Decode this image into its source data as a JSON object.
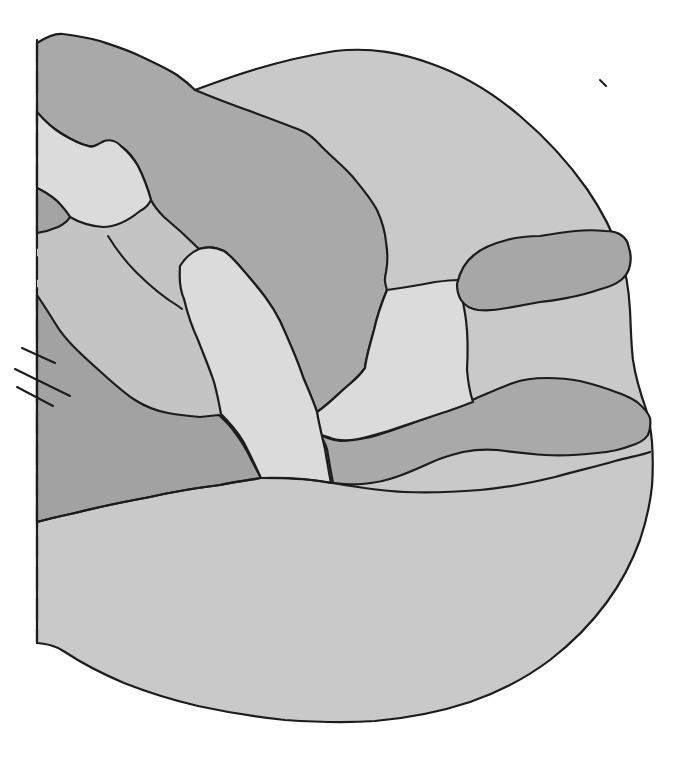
{
  "canvas": {
    "width": 688,
    "height": 764,
    "background_color": "#ffffff"
  },
  "figure": {
    "kind": "grayscale anatomical/embryological line illustration with shaded regions",
    "palette": {
      "outline": "#1c1c1c",
      "disc": "#c9c9c9",
      "channel": "#c4c4c4",
      "band_dark": "#a9a9a9",
      "region_b": "#a2a2a2",
      "light_lobe": "#dbdbdb",
      "tongue": "#a4a4a4",
      "ellipse": "#a7a7a7"
    },
    "stroke_width": 2.2,
    "thin_stroke_width": 2.0,
    "midline_dash": "22 9",
    "shapes": [
      {
        "name": "main-disc",
        "fill_key": "disc",
        "stroked": true,
        "d": "M37,110 C70,102 120,95 195,90 C225,79 272,61 335,51 C372,47 402,53 432,64 C463,75 493,93 520,116 C546,138 568,162 587,189 C602,211 613,232 620,254 C627,274 629,292 630,310 C631,330 631,344 633,360 C636,380 641,395 646,409 C649,419 651,430 652,442 C653,457 653,472 652,486 C650,505 646,522 640,540 C632,562 621,583 607,602 C591,624 572,643 550,660 C526,678 499,692 470,702 C440,712 408,718 375,721 C345,723 315,722 285,720 C255,717 226,712 198,706 C172,700 147,692 124,683 C103,674 83,664 65,652 C55,645 46,644 37,643 Z"
      },
      {
        "name": "mid-channel",
        "fill_key": "channel",
        "stroked": false,
        "d": "M37,233 C47,230 56,226 64,221 L70,217 C80,223 91,226 103,227 C116,227 129,220 140,211 L151,200 C156,208 162,214 170,221 C180,230 190,239 199,249 C192,252 185,258 180,266 C179,280 180,290 184,299 C187,312 192,327 198,340 C203,353 209,367 214,382 C217,393 220,405 220,416 C213,417 206,417 200,417 C189,416 178,415 168,413 C157,411 146,407 135,400 C124,393 113,383 102,373 C93,365 84,357 75,348 C68,341 62,335 55,323 C49,313 43,304 37,295 Z"
      },
      {
        "name": "upper-dark-band",
        "fill_key": "band_dark",
        "stroked": true,
        "d": "M37,43 C48,36 56,33 63,34 C78,36 89,38 100,41 C115,46 128,50 140,56 C155,63 168,69 177,75 C184,80 190,85 195,90 C212,97 230,104 247,110 C266,117 285,124 300,130 C310,134 316,140 322,147 C333,158 343,166 352,176 C361,187 370,197 377,210 C382,221 385,230 386,242 C388,254 388,262 386,272 C384,280 385,284 387,290 C382,302 378,312 374,330 C369,348 366,358 365,368 C358,378 352,382 344,389 C334,398 326,406 317,412 C313,400 308,389 303,377 C296,356 288,339 280,321 C271,303 260,290 249,277 C241,268 233,257 224,251 C216,247 208,246 199,249 C188,238 176,227 164,217 C158,211 154,206 151,200 C148,189 143,176 138,166 C133,157 128,151 122,147 C115,141 106,141 99,145 C93,148 88,146 84,145 C72,141 60,133 49,125 C44,121 40,117 37,112 Z"
      },
      {
        "name": "lower-left-region",
        "fill_key": "region_b",
        "stroked": true,
        "d": "M37,295 C43,304 49,313 55,323 C62,335 68,341 75,348 C84,357 93,365 102,373 C113,383 124,393 135,400 C146,407 157,411 168,413 C178,415 189,416 200,417 L219,415 C224,420 229,424 233,430 C241,440 247,450 252,461 L261,478 C248,480 234,482 220,485 C196,488 172,492 150,497 C123,502 98,507 75,513 C61,516 48,519 37,522 Z"
      },
      {
        "name": "sinuous-band",
        "fill_key": "band_dark",
        "stroked": true,
        "d": "M318,433 C325,438 333,440 341,441 C351,441 361,439 371,437 C389,432 407,425 424,419 C440,413 456,407 470,401 C484,395 499,388 513,383 C524,379 536,378 547,378 C558,378 570,379 580,381 C592,384 603,387 613,391 C622,394 630,397 637,402 C643,407 648,412 650,418 C651,424 650,430 648,435 C644,441 637,444 630,446 C620,450 609,452 597,453 C580,455 562,456 545,455 C529,454 513,452 497,450 C485,449 473,450 463,452 C451,455 440,458 430,463 C419,468 408,473 396,477 C385,481 374,483 362,484 C352,485 342,484 333,483 C331,473 329,461 327,449 C325,443 322,437 318,433 Z"
      },
      {
        "name": "right-light-wedge",
        "fill_key": "light_lobe",
        "stroked": true,
        "d": "M387,290 C401,288 420,285 435,282 C443,281 451,280 458,280 C461,292 464,305 466,320 C468,336 468,352 467,370 C468,382 470,393 473,402 C462,406 452,410 442,413 C424,419 406,425 388,431 C378,434 368,437 358,439 C347,441 337,441 328,437 L318,434 C317,427 317,419 317,412 C326,406 334,398 344,389 C352,382 358,378 365,368 C366,358 369,348 374,330 C378,312 382,302 387,290 Z"
      },
      {
        "name": "right-dark-ellipse",
        "fill_key": "ellipse",
        "stroked": true,
        "d": "M457,284 C460,271 466,261 474,255 C483,247 495,243 507,240 C518,237 529,236 540,236 C552,234 564,232 575,231 C586,230 596,230 605,231 C612,231 617,232 621,235 C626,238 628,242 629,248 C631,254 631,260 630,265 C629,271 626,276 621,280 C616,284 609,287 601,289 C592,292 582,295 572,297 C561,299 551,301 540,302 C529,304 518,306 507,308 C497,310 487,311 478,310 C471,309 465,306 461,300 C458,295 457,290 457,284 Z"
      },
      {
        "name": "upper-left-light-lobe",
        "fill_key": "light_lobe",
        "stroked": true,
        "d": "M37,112 C44,120 52,128 62,134 C72,140 80,144 88,146 C94,148 98,144 104,141 C110,139 117,141 122,147 C128,152 133,158 138,166 C143,176 148,189 151,200 C148,206 144,209 140,211 C129,220 116,227 103,227 C91,226 80,223 70,217 C66,212 62,206 56,200 C50,195 43,191 37,188 Z"
      },
      {
        "name": "left-dark-tongue",
        "fill_key": "tongue",
        "stroked": true,
        "d": "M37,188 C44,191 51,196 57,201 C62,206 67,212 70,217 C68,221 64,224 58,227 C51,230 44,232 37,233 Z"
      },
      {
        "name": "diagonal-light-finger",
        "fill_key": "light_lobe",
        "stroked": true,
        "d": "M199,249 C208,246 216,247 224,251 C233,257 241,268 249,277 C260,290 271,303 280,321 C288,339 296,356 303,377 C308,389 313,400 317,412 C319,424 322,436 325,449 C327,461 329,473 331,483 C320,481 308,479 296,479 C284,478 272,478 261,478 C255,465 249,452 243,441 C237,431 229,422 221,414 C219,403 217,393 214,382 C209,367 203,353 198,340 C192,327 187,312 184,299 C180,290 179,280 180,266 C185,258 192,252 199,249 Z"
      },
      {
        "name": "dome-boundary-line",
        "fill_key": null,
        "stroked": true,
        "d": "M37,522 C48,519 61,516 75,513 C98,507 123,502 150,497 C172,492 196,488 220,485 C234,482 248,480 261,478 C286,477 310,479 333,483 C356,487 380,491 405,492 C430,493 455,492 480,490 C505,488 530,483 555,477 C577,471 598,466 615,461 C630,457 642,455 650,452"
      },
      {
        "name": "crease-line",
        "fill_key": null,
        "stroked": true,
        "thin": true,
        "d": "M108,236 C116,249 125,261 136,272 C149,285 163,297 178,306 L182,309"
      },
      {
        "name": "hash-mark-1",
        "fill_key": null,
        "stroked": true,
        "thin": true,
        "d": "M22,348 L55,363"
      },
      {
        "name": "hash-mark-2",
        "fill_key": null,
        "stroked": true,
        "thin": true,
        "d": "M15,369 L70,396"
      },
      {
        "name": "hash-mark-3",
        "fill_key": null,
        "stroked": true,
        "thin": true,
        "d": "M17,387 L53,406"
      },
      {
        "name": "midline-dashed",
        "fill_key": null,
        "stroked": true,
        "dashed": true,
        "d": "M37,40 L37,643"
      },
      {
        "name": "ink-speck",
        "fill_key": null,
        "stroked": true,
        "thin": true,
        "d": "M600,80 L606,86"
      }
    ]
  }
}
